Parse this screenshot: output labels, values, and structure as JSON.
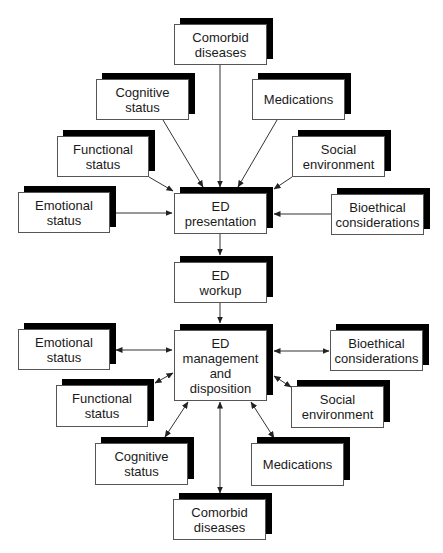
{
  "diagram": {
    "title": "",
    "colors": {
      "box_border": "#555555",
      "shadow": "#000000",
      "text": "#1a1a1a",
      "edge": "#333333"
    },
    "nodes": [
      {
        "id": "top-comorbid",
        "label": "Comorbid\ndiseases",
        "x": 174,
        "y": 24,
        "w": 93,
        "h": 41
      },
      {
        "id": "top-cognitive",
        "label": "Cognitive\nstatus",
        "x": 96,
        "y": 79,
        "w": 93,
        "h": 41
      },
      {
        "id": "top-medications",
        "label": "Medications",
        "x": 252,
        "y": 79,
        "w": 93,
        "h": 41
      },
      {
        "id": "top-functional",
        "label": "Functional\nstatus",
        "x": 57,
        "y": 136,
        "w": 92,
        "h": 41
      },
      {
        "id": "top-social",
        "label": "Social\nenvironment",
        "x": 292,
        "y": 136,
        "w": 93,
        "h": 41
      },
      {
        "id": "top-emotional",
        "label": "Emotional\nstatus",
        "x": 18,
        "y": 192,
        "w": 92,
        "h": 41
      },
      {
        "id": "top-bioethical",
        "label": "Bioethical\nconsiderations",
        "x": 331,
        "y": 194,
        "w": 93,
        "h": 41
      },
      {
        "id": "ed-presentation",
        "label": "ED\npresentation",
        "x": 174,
        "y": 193,
        "w": 93,
        "h": 41
      },
      {
        "id": "ed-workup",
        "label": "ED\nworkup",
        "x": 174,
        "y": 262,
        "w": 93,
        "h": 41
      },
      {
        "id": "ed-management",
        "label": "ED\nmanagement\nand\ndisposition",
        "x": 174,
        "y": 330,
        "w": 93,
        "h": 71
      },
      {
        "id": "bottom-emotional",
        "label": "Emotional\nstatus",
        "x": 18,
        "y": 329,
        "w": 92,
        "h": 41
      },
      {
        "id": "bottom-bioethical",
        "label": "Bioethical\nconsiderations",
        "x": 330,
        "y": 330,
        "w": 93,
        "h": 41
      },
      {
        "id": "bottom-functional",
        "label": "Functional\nstatus",
        "x": 56,
        "y": 385,
        "w": 92,
        "h": 42
      },
      {
        "id": "bottom-social",
        "label": "Social\nenvironment",
        "x": 291,
        "y": 386,
        "w": 93,
        "h": 42
      },
      {
        "id": "bottom-cognitive",
        "label": "Cognitive\nstatus",
        "x": 95,
        "y": 443,
        "w": 93,
        "h": 42
      },
      {
        "id": "bottom-medications",
        "label": "Medications",
        "x": 251,
        "y": 443,
        "w": 93,
        "h": 43
      },
      {
        "id": "bottom-comorbid",
        "label": "Comorbid\ndiseases",
        "x": 173,
        "y": 499,
        "w": 93,
        "h": 41
      }
    ],
    "edges": [
      {
        "from": "top-comorbid",
        "to": "ed-presentation",
        "x1": 220,
        "y1": 65,
        "x2": 220,
        "y2": 187,
        "both": false
      },
      {
        "from": "top-cognitive",
        "to": "ed-presentation",
        "x1": 163,
        "y1": 120,
        "x2": 203,
        "y2": 187,
        "both": false
      },
      {
        "from": "top-medications",
        "to": "ed-presentation",
        "x1": 277,
        "y1": 120,
        "x2": 238,
        "y2": 187,
        "both": false
      },
      {
        "from": "top-functional",
        "to": "ed-presentation",
        "x1": 149,
        "y1": 177,
        "x2": 173,
        "y2": 191,
        "both": false
      },
      {
        "from": "top-social",
        "to": "ed-presentation",
        "x1": 292,
        "y1": 177,
        "x2": 274,
        "y2": 189,
        "both": false
      },
      {
        "from": "top-emotional",
        "to": "ed-presentation",
        "x1": 116,
        "y1": 213,
        "x2": 172,
        "y2": 213,
        "both": false
      },
      {
        "from": "top-bioethical",
        "to": "ed-presentation",
        "x1": 331,
        "y1": 214,
        "x2": 274,
        "y2": 214,
        "both": false
      },
      {
        "from": "ed-presentation",
        "to": "ed-workup",
        "x1": 220,
        "y1": 234,
        "x2": 220,
        "y2": 255,
        "both": false
      },
      {
        "from": "ed-workup",
        "to": "ed-management",
        "x1": 220,
        "y1": 303,
        "x2": 220,
        "y2": 323,
        "both": false
      },
      {
        "from": "ed-management",
        "to": "bottom-emotional",
        "x1": 172,
        "y1": 350,
        "x2": 116,
        "y2": 350,
        "both": true
      },
      {
        "from": "ed-management",
        "to": "bottom-bioethical",
        "x1": 274,
        "y1": 351,
        "x2": 329,
        "y2": 351,
        "both": true
      },
      {
        "from": "ed-management",
        "to": "bottom-functional",
        "x1": 173,
        "y1": 373,
        "x2": 155,
        "y2": 383,
        "both": true
      },
      {
        "from": "ed-management",
        "to": "bottom-social",
        "x1": 274,
        "y1": 376,
        "x2": 291,
        "y2": 387,
        "both": true
      },
      {
        "from": "ed-management",
        "to": "bottom-cognitive",
        "x1": 188,
        "y1": 402,
        "x2": 165,
        "y2": 437,
        "both": true
      },
      {
        "from": "ed-management",
        "to": "bottom-comorbid",
        "x1": 220,
        "y1": 402,
        "x2": 220,
        "y2": 493,
        "both": true
      },
      {
        "from": "ed-management",
        "to": "bottom-medications",
        "x1": 251,
        "y1": 402,
        "x2": 274,
        "y2": 438,
        "both": true
      }
    ]
  }
}
